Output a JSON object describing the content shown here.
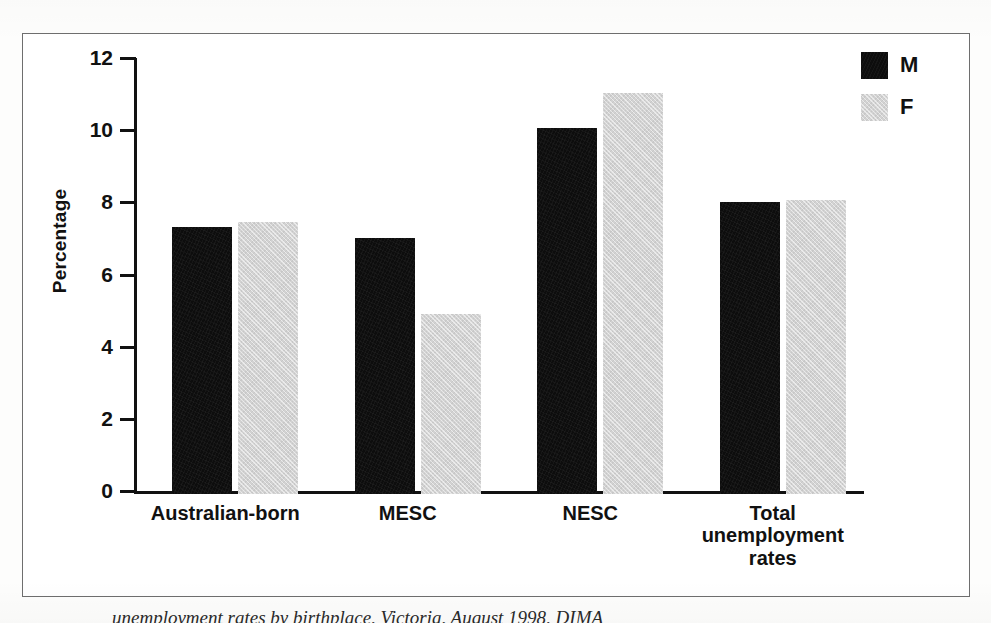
{
  "figure": {
    "frame_color": "#6e6e6e",
    "background": "#ffffff"
  },
  "caption_partial": "unemployment rates by birthplace, Victoria, August 1998, DIMA",
  "legend": {
    "position": "top-right",
    "entries": [
      {
        "label": "M",
        "name": "male",
        "color": "#0d0d0d"
      },
      {
        "label": "F",
        "name": "female",
        "color": "#d2d2d2"
      }
    ]
  },
  "axes": {
    "ylabel": "Percentage",
    "yticks": [
      "0",
      "2",
      "4",
      "6",
      "8",
      "10",
      "12"
    ],
    "xlabel": ""
  },
  "chart_data": {
    "type": "bar",
    "title": "",
    "xlabel": "",
    "ylabel": "Percentage",
    "ylim": [
      0,
      12
    ],
    "ytick_step": 2,
    "grid": false,
    "legend_position": "top-right",
    "categories": [
      "Australian-born",
      "MESC",
      "NESC",
      "Total unemployment rates"
    ],
    "category_lines": [
      [
        "Australian-born"
      ],
      [
        "MESC"
      ],
      [
        "NESC"
      ],
      [
        "Total",
        "unemployment",
        "rates"
      ]
    ],
    "series": [
      {
        "name": "M",
        "color": "#0d0d0d",
        "values": [
          7.4,
          7.1,
          10.15,
          8.1
        ]
      },
      {
        "name": "F",
        "color": "#d2d2d2",
        "values": [
          7.55,
          5.0,
          11.1,
          8.15
        ]
      }
    ]
  }
}
